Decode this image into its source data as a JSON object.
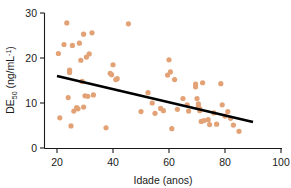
{
  "chart_data": {
    "type": "scatter",
    "title": "",
    "xlabel": "Idade (anos)",
    "ylabel_main": "DE",
    "ylabel_sub": "50",
    "ylabel_units_pre": " (ng/mL",
    "ylabel_units_sup": "-1",
    "ylabel_units_post": ")",
    "ylabel_full": "DE50 (ng/mL-1)",
    "xlim": [
      14,
      104
    ],
    "ylim": [
      -1.5,
      31
    ],
    "xticks": [
      20,
      40,
      60,
      80,
      100
    ],
    "yticks": [
      0,
      10,
      20,
      30
    ],
    "xtick_labels": [
      "20",
      "40",
      "60",
      "80",
      "100"
    ],
    "ytick_labels": [
      "0",
      "10",
      "20",
      "30"
    ],
    "grid": false,
    "legend": false,
    "marker_color": "#e3a276",
    "line_color": "#000000",
    "axis_color": "#1a1a1a",
    "series": [
      {
        "name": "DE50 vs Idade",
        "points": [
          [
            20.5,
            21.0
          ],
          [
            21.0,
            6.7
          ],
          [
            22.5,
            23.0
          ],
          [
            23.5,
            27.8
          ],
          [
            24.0,
            11.2
          ],
          [
            24.5,
            17.3
          ],
          [
            24.5,
            16.8
          ],
          [
            25.0,
            4.9
          ],
          [
            25.5,
            22.8
          ],
          [
            26.0,
            8.2
          ],
          [
            27.0,
            9.0
          ],
          [
            27.5,
            8.7
          ],
          [
            28.0,
            23.3
          ],
          [
            28.5,
            19.5
          ],
          [
            29.0,
            14.8
          ],
          [
            29.5,
            25.3
          ],
          [
            29.5,
            9.1
          ],
          [
            30.0,
            11.6
          ],
          [
            30.5,
            20.2
          ],
          [
            31.0,
            11.5
          ],
          [
            31.5,
            20.9
          ],
          [
            32.5,
            25.6
          ],
          [
            33.0,
            11.8
          ],
          [
            37.5,
            4.5
          ],
          [
            39.0,
            16.6
          ],
          [
            39.5,
            16.3
          ],
          [
            40.0,
            18.5
          ],
          [
            41.0,
            15.2
          ],
          [
            41.5,
            15.4
          ],
          [
            45.5,
            27.6
          ],
          [
            50.0,
            8.1
          ],
          [
            52.5,
            12.3
          ],
          [
            54.0,
            10.0
          ],
          [
            55.0,
            7.7
          ],
          [
            57.0,
            8.8
          ],
          [
            58.0,
            8.3
          ],
          [
            59.5,
            16.2
          ],
          [
            60.0,
            19.6
          ],
          [
            60.5,
            16.9
          ],
          [
            61.0,
            4.3
          ],
          [
            62.0,
            15.2
          ],
          [
            63.0,
            8.6
          ],
          [
            65.0,
            11.0
          ],
          [
            66.5,
            9.6
          ],
          [
            67.0,
            8.2
          ],
          [
            69.5,
            14.2
          ],
          [
            69.5,
            13.6
          ],
          [
            70.0,
            11.0
          ],
          [
            70.5,
            9.8
          ],
          [
            70.5,
            9.2
          ],
          [
            71.0,
            8.7
          ],
          [
            71.0,
            8.3
          ],
          [
            71.5,
            5.9
          ],
          [
            72.0,
            14.5
          ],
          [
            72.5,
            6.1
          ],
          [
            74.0,
            6.3
          ],
          [
            74.5,
            5.2
          ],
          [
            76.0,
            7.8
          ],
          [
            77.0,
            5.3
          ],
          [
            78.5,
            14.3
          ],
          [
            79.0,
            9.6
          ],
          [
            80.0,
            7.1
          ],
          [
            81.0,
            8.1
          ],
          [
            82.0,
            6.6
          ],
          [
            83.0,
            5.1
          ],
          [
            85.0,
            3.7
          ]
        ]
      }
    ],
    "fit_line": {
      "name": "linha de regressao",
      "x_start": 20,
      "y_start": 16.0,
      "x_end": 90,
      "y_end": 5.8
    }
  }
}
